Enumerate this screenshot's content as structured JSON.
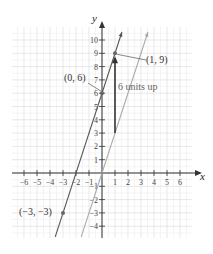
{
  "chart_data": {
    "type": "line",
    "title": "",
    "xlabel": "x",
    "ylabel": "y",
    "xlim": [
      -7,
      7
    ],
    "ylim": [
      -5,
      11
    ],
    "grid": true,
    "x_ticks": [
      -6,
      -5,
      -4,
      -3,
      -2,
      -1,
      1,
      2,
      3,
      4,
      5,
      6
    ],
    "y_ticks": [
      -4,
      -3,
      -2,
      -1,
      1,
      2,
      3,
      4,
      5,
      6,
      7,
      8,
      9,
      10
    ],
    "series": [
      {
        "name": "y = 3x + 6",
        "color": "#555555",
        "slope": 3,
        "intercept": 6
      },
      {
        "name": "y = 3x",
        "color": "#aaaaaa",
        "slope": 3,
        "intercept": 0
      }
    ],
    "points": [
      {
        "label": "(0, 6)",
        "x": 0,
        "y": 6
      },
      {
        "label": "(1, 9)",
        "x": 1,
        "y": 9
      },
      {
        "label": "(−3, −3)",
        "x": -3,
        "y": -3
      }
    ],
    "annotations": [
      {
        "text": "6 units up",
        "arrow_from": [
          1,
          3
        ],
        "arrow_to": [
          1,
          9
        ]
      }
    ]
  },
  "labels": {
    "x_axis": "x",
    "y_axis": "y",
    "p1": "(0, 6)",
    "p2": "(1, 9)",
    "p3": "(−3, −3)",
    "shift": "6 units up"
  }
}
